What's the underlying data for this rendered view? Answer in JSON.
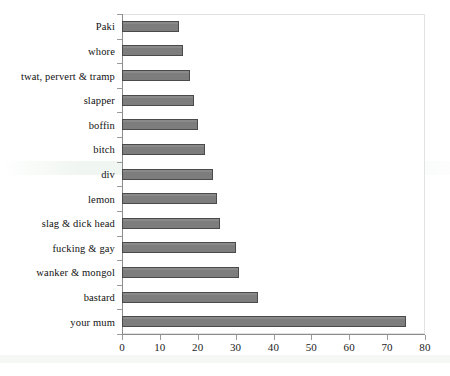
{
  "chart_data": {
    "type": "bar",
    "orientation": "horizontal",
    "title": "",
    "subtitle": "",
    "xlabel": "",
    "ylabel": "",
    "xlim": [
      0,
      80
    ],
    "ylim": null,
    "grid": false,
    "legend": null,
    "legend_position": "none",
    "xticks": [
      "0",
      "10",
      "20",
      "30",
      "40",
      "50",
      "60",
      "70",
      "80"
    ],
    "xtick_values": [
      0,
      10,
      20,
      30,
      40,
      50,
      60,
      70,
      80
    ],
    "categories": [
      "Paki",
      "whore",
      "twat, pervert & tramp",
      "slapper",
      "boffin",
      "bitch",
      "div",
      "lemon",
      "slag & dick head",
      "fucking & gay",
      "wanker & mongol",
      "bastard",
      "your mum"
    ],
    "values": [
      15,
      16,
      18,
      19,
      20,
      22,
      24,
      25,
      26,
      30,
      31,
      36,
      75
    ],
    "series": [
      {
        "name": "count",
        "values": [
          15,
          16,
          18,
          19,
          20,
          22,
          24,
          25,
          26,
          30,
          31,
          36,
          75
        ]
      }
    ],
    "colors": {
      "bar_fill": "#7d7d7d",
      "bar_border": "#4a4a4a",
      "axis": "#8c8c8c",
      "plot_border": "#e2e2e2",
      "text": "#111111",
      "background": "#ffffff"
    }
  }
}
